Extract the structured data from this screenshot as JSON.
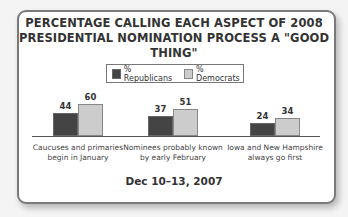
{
  "title_line1": "PERCENTAGE CALLING EACH ASPECT OF 2008",
  "title_line2": "PRESIDENTIAL NOMINATION PROCESS A \"GOOD THING\"",
  "legend": [
    {
      "label": "% Republicans",
      "color": "#444444"
    },
    {
      "label": "% Democrats",
      "color": "#cccccc"
    }
  ],
  "date_label": "Dec 10–13, 2007",
  "categories_lines": [
    [
      "Caucuses and primaries",
      "begin in January"
    ],
    [
      "Nominees probably known",
      "by early February"
    ],
    [
      "Iowa and New Hampshire",
      "always go first"
    ]
  ],
  "chart_data": {
    "type": "bar",
    "title": "PERCENTAGE CALLING EACH ASPECT OF 2008 PRESIDENTIAL NOMINATION PROCESS A \"GOOD THING\"",
    "subtitle": "Dec 10–13, 2007",
    "categories": [
      "Caucuses and primaries begin in January",
      "Nominees probably known by early February",
      "Iowa and New Hampshire always go first"
    ],
    "series": [
      {
        "name": "% Republicans",
        "values": [
          44,
          37,
          24
        ],
        "color": "#444444"
      },
      {
        "name": "% Democrats",
        "values": [
          60,
          51,
          34
        ],
        "color": "#cccccc"
      }
    ],
    "xlabel": "",
    "ylabel": "",
    "ylim": [
      0,
      100
    ],
    "grid": false,
    "legend_position": "top",
    "data_labels": true
  }
}
